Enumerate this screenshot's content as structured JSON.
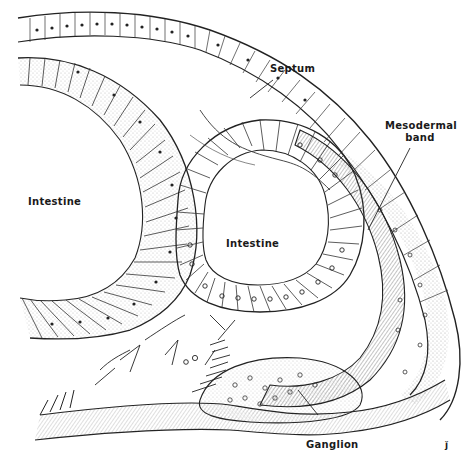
{
  "figure": {
    "labels": {
      "septum": "Septum",
      "mesodermal_band_line1": "Mesodermal",
      "mesodermal_band_line2": "band",
      "intestine_left": "Intestine",
      "intestine_center": "Intestine",
      "ganglion": "Ganglion",
      "signature": "ǰ"
    }
  }
}
